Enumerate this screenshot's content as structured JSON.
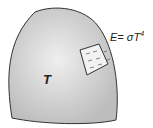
{
  "diagram": {
    "body_label": "T",
    "equation": "E= σT",
    "equation_exponent": "4",
    "colors": {
      "body_fill": "#c8c8c8",
      "body_highlight": "#ececec",
      "outline": "#333333",
      "patch_fill": "#f2f2f2"
    }
  }
}
